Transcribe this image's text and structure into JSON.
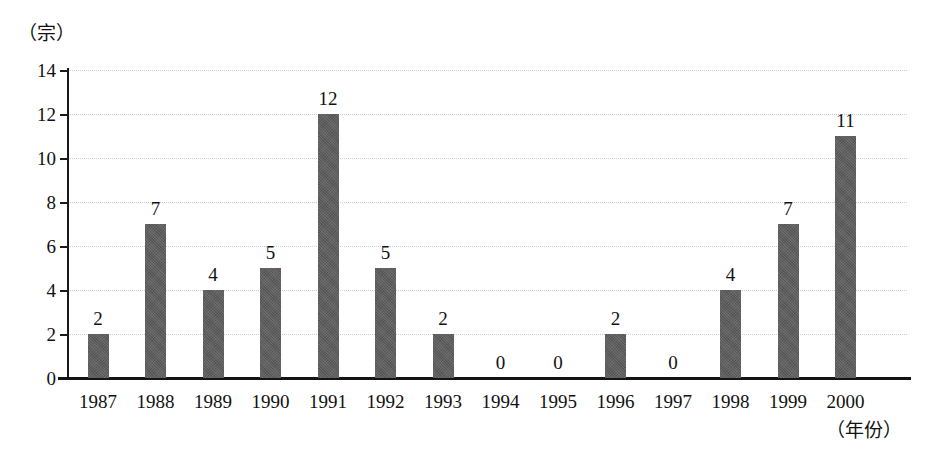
{
  "chart_data": {
    "type": "bar",
    "title": "",
    "subtitle": "",
    "xlabel": "（年份）",
    "ylabel": "（宗）",
    "categories": [
      "1987",
      "1988",
      "1989",
      "1990",
      "1991",
      "1992",
      "1993",
      "1994",
      "1995",
      "1996",
      "1997",
      "1998",
      "1999",
      "2000"
    ],
    "values": [
      2,
      7,
      4,
      5,
      12,
      5,
      2,
      0,
      0,
      2,
      0,
      4,
      7,
      11
    ],
    "value_labels": [
      "2",
      "7",
      "4",
      "5",
      "12",
      "5",
      "2",
      "0",
      "0",
      "2",
      "0",
      "4",
      "7",
      "11"
    ],
    "ylim": [
      0,
      14
    ],
    "ytick_values": [
      0,
      2,
      4,
      6,
      8,
      10,
      12,
      14
    ],
    "ytick_labels": [
      "0",
      "2",
      "4",
      "6",
      "8",
      "10",
      "12",
      "14"
    ],
    "grid": true,
    "grid_axis": "y",
    "legend": "none",
    "bar_color": "#5d5d5d",
    "grid_color": "#c9ccd2",
    "axis_color": "#141414",
    "background_color": "#ffffff"
  }
}
